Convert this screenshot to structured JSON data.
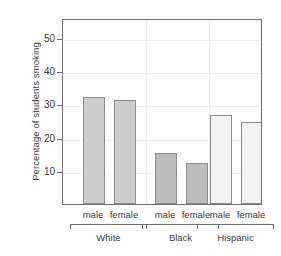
{
  "chart_data": {
    "type": "bar",
    "title": "",
    "xlabel": "",
    "ylabel": "Percentage of students smoking",
    "ylim": [
      0,
      56
    ],
    "yticks": [
      10,
      20,
      30,
      40,
      50
    ],
    "ytick_labels": [
      "10",
      "20",
      "30",
      "40",
      "50"
    ],
    "grid": true,
    "legend": "none",
    "categories": [
      "White",
      "Black",
      "Hispanic"
    ],
    "subcategories": [
      "male",
      "female"
    ],
    "bars": [
      {
        "group": "White",
        "sex": "male",
        "value": 32.3,
        "color": "#cdcdcd"
      },
      {
        "group": "White",
        "sex": "female",
        "value": 31.4,
        "color": "#cdcdcd"
      },
      {
        "group": "Black",
        "sex": "male",
        "value": 15.4,
        "color": "#bcbcbc"
      },
      {
        "group": "Black",
        "sex": "female",
        "value": 12.3,
        "color": "#bcbcbc"
      },
      {
        "group": "Hispanic",
        "sex": "male",
        "value": 26.8,
        "color": "#f2f2f2"
      },
      {
        "group": "Hispanic",
        "sex": "female",
        "value": 24.8,
        "color": "#f2f2f2"
      }
    ],
    "series": [
      {
        "name": "male",
        "values": [
          32.3,
          15.4,
          26.8
        ]
      },
      {
        "name": "female",
        "values": [
          31.4,
          12.3,
          24.8
        ]
      }
    ],
    "colors": {
      "white_group": "#cdcdcd",
      "black_group": "#bcbcbc",
      "hispanic_group": "#f2f2f2",
      "bar_outline": "#8c8c8c",
      "axis": "#6f6f6f",
      "grid": "#ececec",
      "text": "#3a3a3a"
    }
  },
  "labels": {
    "y_axis_title": "Percentage of students smoking",
    "sex": {
      "white_male": "male",
      "white_female": "female",
      "black_male": "male",
      "black_female": "female",
      "hispanic_male": "male",
      "hispanic_female": "female"
    },
    "groups": {
      "white": "White",
      "black": "Black",
      "hispanic": "Hispanic"
    },
    "yticks": {
      "t10": "10",
      "t20": "20",
      "t30": "30",
      "t40": "40",
      "t50": "50"
    }
  }
}
